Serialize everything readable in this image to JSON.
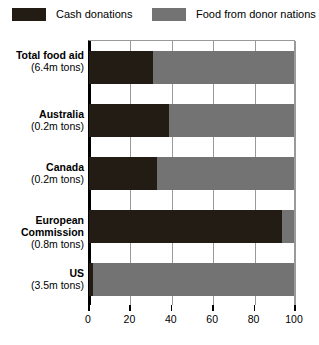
{
  "legend": {
    "entries": [
      {
        "label": "Cash donations",
        "color": "#221c14",
        "swatch_icon": "legend-swatch-icon"
      },
      {
        "label": "Food from donor nations",
        "color": "#737373",
        "swatch_icon": "legend-swatch-icon"
      }
    ]
  },
  "axis": {
    "x_ticks": [
      "0",
      "20",
      "40",
      "60",
      "80",
      "100"
    ]
  },
  "categories": [
    {
      "name": "Total food aid",
      "sub": "(6.4m tons)"
    },
    {
      "name": "Australia",
      "sub": "(0.2m tons)"
    },
    {
      "name": "Canada",
      "sub": "(0.2m tons)"
    },
    {
      "name": "European Commission",
      "sub": "(0.8m tons)"
    },
    {
      "name": "US",
      "sub": "(3.5m tons)"
    }
  ],
  "chart_data": {
    "type": "bar",
    "orientation": "horizontal",
    "stacked": true,
    "title": "",
    "subtitle": "",
    "xlabel": "",
    "ylabel": "",
    "xlim": [
      0,
      100
    ],
    "xticks": [
      0,
      20,
      40,
      60,
      80,
      100
    ],
    "grid": true,
    "legend_position": "top",
    "categories": [
      "Total food aid (6.4m tons)",
      "Australia (0.2m tons)",
      "Canada (0.2m tons)",
      "European Commission (0.8m tons)",
      "US (3.5m tons)"
    ],
    "series": [
      {
        "name": "Cash donations",
        "color": "#221c14",
        "values": [
          31,
          39,
          33,
          94,
          2
        ]
      },
      {
        "name": "Food from donor nations",
        "color": "#737373",
        "values": [
          69,
          61,
          67,
          6,
          98
        ]
      }
    ],
    "units": "percent"
  }
}
